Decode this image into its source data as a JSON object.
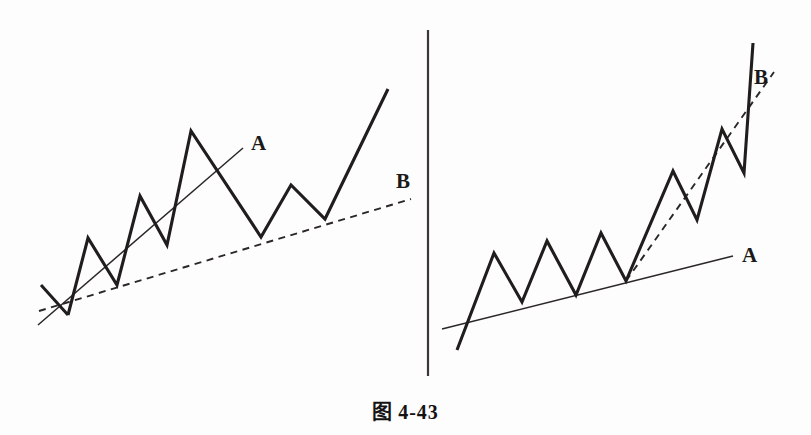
{
  "figure": {
    "caption_label": "图",
    "caption_number": "4-43",
    "background_color": "#fdfdfd",
    "line_color": "#201d1c",
    "trendline_color": "#2a2726"
  },
  "divider": {
    "name": "panel-divider",
    "x": 428,
    "y_top": 30,
    "y_bottom": 376
  },
  "chart_data": {
    "type": "line",
    "xlabel": "",
    "ylabel": "",
    "grid": false,
    "legend": "none",
    "note": "Two schematic price-trend panels illustrating trendline A (steep) versus trendline B (shallow) and their roles as support after a rally; y values are screen pixels with y increasing downward.",
    "panels": [
      {
        "name": "left-panel",
        "description": "Rally where steep trendline A is broken and shallower trendline B becomes the valid support line.",
        "price_path": {
          "name": "left-price-path",
          "points": [
            [
              41,
              285
            ],
            [
              68,
              315
            ],
            [
              88,
              238
            ],
            [
              117,
              285
            ],
            [
              140,
              196
            ],
            [
              167,
              245
            ],
            [
              191,
              131
            ],
            [
              261,
              237
            ],
            [
              291,
              185
            ],
            [
              325,
              219
            ],
            [
              388,
              89
            ]
          ]
        },
        "trendlines": [
          {
            "name": "left-trendline-a",
            "label": "A",
            "style": "solid",
            "x1": 38,
            "y1": 325,
            "x2": 243,
            "y2": 148,
            "label_x": 251,
            "label_y": 150
          },
          {
            "name": "left-trendline-b",
            "label": "B",
            "style": "dashed",
            "x1": 39,
            "y1": 311,
            "x2": 411,
            "y2": 199,
            "label_x": 396,
            "label_y": 188
          }
        ]
      },
      {
        "name": "right-panel",
        "description": "Rally where shallow trendline A holds through a flat base and steeper trendline B tracks the accelerating advance.",
        "price_path": {
          "name": "right-price-path",
          "points": [
            [
              457,
              350
            ],
            [
              494,
              253
            ],
            [
              522,
              302
            ],
            [
              547,
              241
            ],
            [
              576,
              295
            ],
            [
              601,
              233
            ],
            [
              626,
              281
            ],
            [
              673,
              171
            ],
            [
              697,
              220
            ],
            [
              722,
              129
            ],
            [
              744,
              173
            ],
            [
              753,
              43
            ]
          ]
        },
        "trendlines": [
          {
            "name": "right-trendline-a",
            "label": "A",
            "style": "solid",
            "x1": 442,
            "y1": 329,
            "x2": 733,
            "y2": 256,
            "label_x": 742,
            "label_y": 262
          },
          {
            "name": "right-trendline-b",
            "label": "B",
            "style": "dashed",
            "x1": 626,
            "y1": 281,
            "x2": 774,
            "y2": 72,
            "label_x": 754,
            "label_y": 84
          }
        ]
      }
    ]
  },
  "labels": {
    "left_a": "A",
    "left_b": "B",
    "right_a": "A",
    "right_b": "B"
  }
}
